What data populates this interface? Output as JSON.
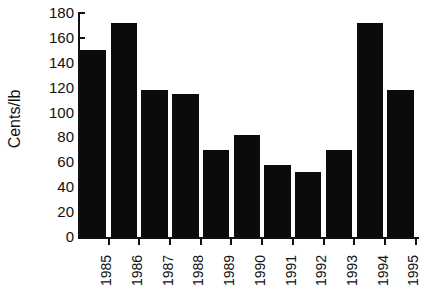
{
  "chart_data": {
    "type": "bar",
    "title": "",
    "xlabel": "",
    "ylabel": "Cents/lb",
    "categories": [
      "1985",
      "1986",
      "1987",
      "1988",
      "1989",
      "1990",
      "1991",
      "1992",
      "1993",
      "1994",
      "1995"
    ],
    "values": [
      150,
      172,
      118,
      115,
      70,
      82,
      58,
      52,
      70,
      172,
      118
    ],
    "ylim": [
      0,
      180
    ],
    "ytick_values": [
      0,
      20,
      40,
      60,
      80,
      100,
      120,
      140,
      160,
      180
    ],
    "ytick_labels": [
      "0",
      "20",
      "40",
      "60",
      "80",
      "100",
      "120",
      "140",
      "160",
      "180"
    ],
    "grid": false,
    "legend": false,
    "legend_position": "none",
    "bar_color": "#0b0b0b",
    "background_color": "#ffffff",
    "axis_color": "#111111",
    "xtick_label_rotation": 90
  },
  "figure": {
    "caption": ""
  }
}
